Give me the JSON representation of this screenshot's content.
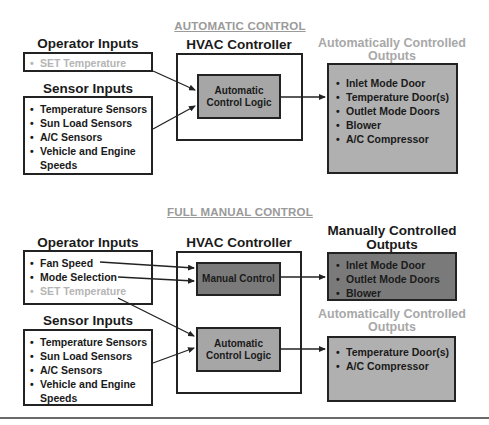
{
  "automatic": {
    "title": "AUTOMATIC CONTROL",
    "operator_inputs": {
      "heading": "Operator Inputs",
      "items": [
        {
          "label": "SET Temperature",
          "muted": true
        }
      ]
    },
    "sensor_inputs": {
      "heading": "Sensor Inputs",
      "items": [
        {
          "label": "Temperature Sensors"
        },
        {
          "label": "Sun Load Sensors"
        },
        {
          "label": "A/C Sensors"
        },
        {
          "label": "Vehicle and Engine"
        },
        {
          "label": "Speeds",
          "continuation": true
        }
      ]
    },
    "controller": {
      "heading": "HVAC Controller",
      "logic_line1": "Automatic",
      "logic_line2": "Control Logic"
    },
    "outputs": {
      "heading_line1": "Automatically Controlled",
      "heading_line2": "Outputs",
      "items": [
        {
          "label": "Inlet Mode Door"
        },
        {
          "label": "Temperature Door(s)"
        },
        {
          "label": "Outlet Mode Doors"
        },
        {
          "label": "Blower"
        },
        {
          "label": "A/C Compressor"
        }
      ]
    }
  },
  "manual": {
    "title": "FULL MANUAL CONTROL",
    "operator_inputs": {
      "heading": "Operator Inputs",
      "items": [
        {
          "label": "Fan Speed"
        },
        {
          "label": "Mode Selection"
        },
        {
          "label": "SET Temperature",
          "muted": true
        }
      ]
    },
    "sensor_inputs": {
      "heading": "Sensor Inputs",
      "items": [
        {
          "label": "Temperature Sensors"
        },
        {
          "label": "Sun Load Sensors"
        },
        {
          "label": "A/C Sensors"
        },
        {
          "label": "Vehicle and Engine"
        },
        {
          "label": "Speeds",
          "continuation": true
        }
      ]
    },
    "controller": {
      "heading": "HVAC Controller",
      "manual_label": "Manual Control",
      "logic_line1": "Automatic",
      "logic_line2": "Control Logic"
    },
    "manual_outputs": {
      "heading_line1": "Manually Controlled",
      "heading_line2": "Outputs",
      "items": [
        {
          "label": "Inlet Mode Door"
        },
        {
          "label": "Outlet Mode Doors"
        },
        {
          "label": "Blower"
        }
      ]
    },
    "auto_outputs": {
      "heading_line1": "Automatically Controlled",
      "heading_line2": "Outputs",
      "items": [
        {
          "label": "Temperature Door(s)"
        },
        {
          "label": "A/C Compressor"
        }
      ]
    }
  },
  "colors": {
    "title_gray": "#9a9a9a",
    "muted_text": "#b5b5b5",
    "logic_fill": "#a6a6a6",
    "manual_fill": "#7a7a7a",
    "output_fill": "#b0b0b0",
    "stroke": "#222222"
  }
}
